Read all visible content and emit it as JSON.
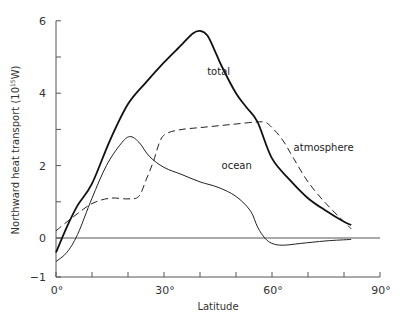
{
  "chart_data": {
    "type": "line",
    "title": "",
    "xlabel": "Latitude",
    "ylabel": "Northward heat transport (10^15 W)",
    "ylabel_base": "Northward heat transport (10",
    "ylabel_exp": "15",
    "ylabel_unit": "W)",
    "xlim": [
      0,
      90
    ],
    "ylim": [
      -1,
      6
    ],
    "x_ticks": [
      0,
      10,
      20,
      30,
      40,
      50,
      60,
      70,
      80,
      90
    ],
    "x_tick_labels": [
      {
        "value": 0,
        "label": "0°"
      },
      {
        "value": 30,
        "label": "30°"
      },
      {
        "value": 60,
        "label": "60°"
      },
      {
        "value": 90,
        "label": "90°"
      }
    ],
    "y_ticks": [
      -1,
      0,
      1,
      2,
      3,
      4,
      5,
      6
    ],
    "y_tick_labels": [
      {
        "value": -1,
        "label": "−1"
      },
      {
        "value": 0,
        "label": "0"
      },
      {
        "value": 2,
        "label": "2"
      },
      {
        "value": 4,
        "label": "4"
      },
      {
        "value": 6,
        "label": "6"
      }
    ],
    "grid": false,
    "zero_line": true,
    "legend": "inline labels",
    "series": [
      {
        "name": "total",
        "style": "solid-thick",
        "label_pos": {
          "x": 42,
          "y": 4.5
        },
        "points": [
          [
            0,
            -0.4
          ],
          [
            3,
            0.3
          ],
          [
            6,
            0.9
          ],
          [
            10,
            1.5
          ],
          [
            15,
            2.7
          ],
          [
            20,
            3.7
          ],
          [
            25,
            4.3
          ],
          [
            30,
            4.85
          ],
          [
            35,
            5.35
          ],
          [
            38,
            5.65
          ],
          [
            40,
            5.72
          ],
          [
            42,
            5.6
          ],
          [
            44,
            5.2
          ],
          [
            46,
            4.75
          ],
          [
            50,
            4.0
          ],
          [
            53,
            3.6
          ],
          [
            56,
            3.2
          ],
          [
            60,
            2.2
          ],
          [
            65,
            1.6
          ],
          [
            70,
            1.1
          ],
          [
            75,
            0.75
          ],
          [
            80,
            0.45
          ],
          [
            82,
            0.36
          ]
        ]
      },
      {
        "name": "atmosphere",
        "style": "dashed",
        "label_pos": {
          "x": 66,
          "y": 2.4
        },
        "points": [
          [
            0,
            0.2
          ],
          [
            5,
            0.6
          ],
          [
            10,
            0.95
          ],
          [
            15,
            1.1
          ],
          [
            20,
            1.08
          ],
          [
            23,
            1.15
          ],
          [
            25,
            1.6
          ],
          [
            27,
            2.1
          ],
          [
            29,
            2.7
          ],
          [
            31,
            2.9
          ],
          [
            35,
            3.0
          ],
          [
            40,
            3.05
          ],
          [
            45,
            3.1
          ],
          [
            50,
            3.15
          ],
          [
            55,
            3.2
          ],
          [
            58,
            3.2
          ],
          [
            60,
            3.05
          ],
          [
            63,
            2.7
          ],
          [
            66,
            2.2
          ],
          [
            70,
            1.55
          ],
          [
            75,
            0.95
          ],
          [
            80,
            0.45
          ],
          [
            82,
            0.25
          ]
        ]
      },
      {
        "name": "ocean",
        "style": "solid-thin",
        "label_pos": {
          "x": 46,
          "y": 1.9
        },
        "points": [
          [
            0,
            -0.65
          ],
          [
            3,
            -0.4
          ],
          [
            6,
            0.1
          ],
          [
            10,
            1.1
          ],
          [
            14,
            2.0
          ],
          [
            18,
            2.6
          ],
          [
            20.5,
            2.8
          ],
          [
            23,
            2.65
          ],
          [
            26,
            2.25
          ],
          [
            30,
            1.95
          ],
          [
            35,
            1.75
          ],
          [
            40,
            1.55
          ],
          [
            45,
            1.4
          ],
          [
            50,
            1.15
          ],
          [
            54,
            0.75
          ],
          [
            56,
            0.3
          ],
          [
            58,
            0.0
          ],
          [
            60,
            -0.15
          ],
          [
            63,
            -0.2
          ],
          [
            68,
            -0.15
          ],
          [
            75,
            -0.08
          ],
          [
            82,
            -0.04
          ]
        ]
      }
    ]
  }
}
